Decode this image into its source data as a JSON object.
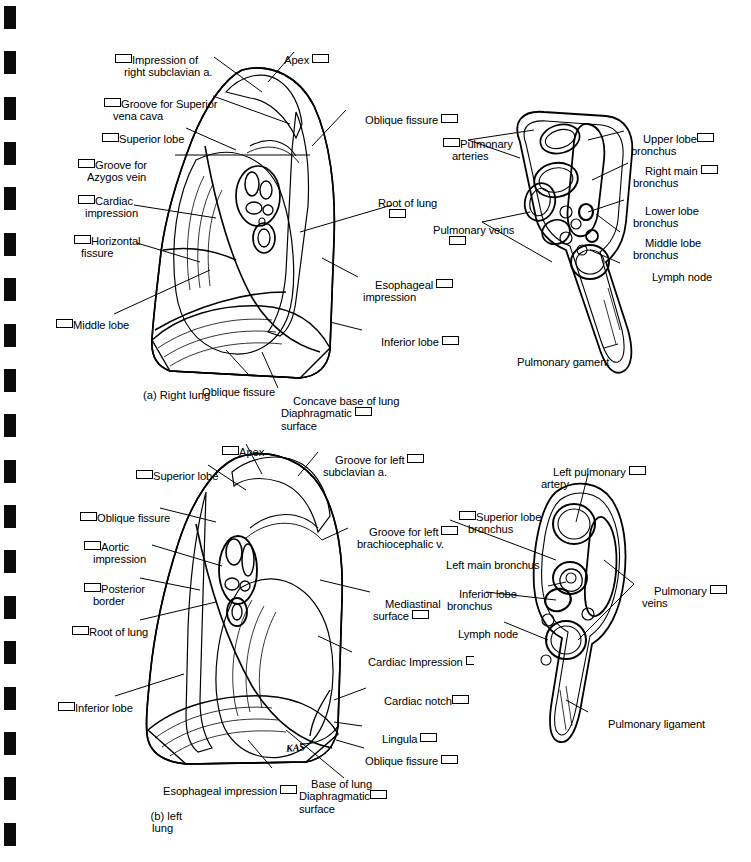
{
  "page": {
    "background": "#ffffff",
    "ink": "#000000",
    "width": 751,
    "height": 862,
    "binding_marks": 19
  },
  "figures": [
    {
      "id": "right-lung",
      "caption": "(a) Right lung",
      "labels_left": [
        {
          "name": "impression-of-right-subclavian-a",
          "lines": [
            "Impression of",
            "right subclavian a."
          ],
          "box": "before"
        },
        {
          "name": "groove-for-superior-vena-cava",
          "lines": [
            "Groove for Superior",
            "vena cava"
          ],
          "box": "before"
        },
        {
          "name": "superior-lobe",
          "lines": [
            "Superior lobe"
          ],
          "box": "before"
        },
        {
          "name": "groove-for-azygos-vein",
          "lines": [
            "Groove for",
            "Azygos vein"
          ],
          "box": "before"
        },
        {
          "name": "cardiac-impression",
          "lines": [
            "Cardiac",
            "impression"
          ],
          "box": "before"
        },
        {
          "name": "horizontal-fissure",
          "lines": [
            "Horizontal",
            "fissure"
          ],
          "box": "before"
        },
        {
          "name": "middle-lobe",
          "lines": [
            "Middle lobe"
          ],
          "box": "before"
        }
      ],
      "labels_other": [
        {
          "name": "apex",
          "lines": [
            "Apex"
          ],
          "box": "after"
        },
        {
          "name": "oblique-fissure-upper",
          "lines": [
            "Oblique fissure"
          ],
          "box": "after"
        },
        {
          "name": "root-of-lung",
          "lines": [
            "Root of lung"
          ],
          "box": "below"
        },
        {
          "name": "esophageal-impression",
          "lines": [
            "Esophageal",
            "impression"
          ],
          "box": "after-first-line"
        },
        {
          "name": "inferior-lobe",
          "lines": [
            "Inferior lobe"
          ],
          "box": "after"
        },
        {
          "name": "oblique-fissure-lower",
          "lines": [
            "Oblique fissure"
          ],
          "box": "none"
        },
        {
          "name": "concave-base-diaphragmatic-surface",
          "lines": [
            "Concave base of lung",
            "Diaphragmatic",
            "surface"
          ],
          "box": "after-second-line"
        }
      ]
    },
    {
      "id": "right-hilum",
      "labels": [
        {
          "name": "pulmonary-arteries",
          "lines": [
            "Pulmonary",
            "arteries"
          ],
          "box": "before"
        },
        {
          "name": "pulmonary-veins",
          "lines": [
            "Pulmonary veins"
          ],
          "box": "below"
        },
        {
          "name": "upper-lobe-bronchus",
          "lines": [
            "Upper lobe",
            "bronchus"
          ],
          "box": "after-first-line"
        },
        {
          "name": "right-main-bronchus",
          "lines": [
            "Right main",
            "bronchus"
          ],
          "box": "after-first-line"
        },
        {
          "name": "lower-lobe-bronchus",
          "lines": [
            "Lower lobe",
            "bronchus"
          ],
          "box": "none"
        },
        {
          "name": "middle-lobe-bronchus",
          "lines": [
            "Middle lobe",
            "bronchus"
          ],
          "box": "none"
        },
        {
          "name": "lymph-node",
          "lines": [
            "Lymph node"
          ],
          "box": "none"
        },
        {
          "name": "pulmonary-gament",
          "lines": [
            "Pulmonary gament"
          ],
          "box": "none"
        }
      ]
    },
    {
      "id": "left-lung",
      "caption": "(b) left\n    lung",
      "labels_left": [
        {
          "name": "apex",
          "lines": [
            "Apex"
          ],
          "box": "before"
        },
        {
          "name": "superior-lobe",
          "lines": [
            "Superior lobe"
          ],
          "box": "before"
        },
        {
          "name": "oblique-fissure",
          "lines": [
            "Oblique fissure"
          ],
          "box": "before"
        },
        {
          "name": "aortic-impression",
          "lines": [
            "Aortic",
            "impression"
          ],
          "box": "before"
        },
        {
          "name": "posterior-border",
          "lines": [
            "Posterior",
            "border"
          ],
          "box": "before"
        },
        {
          "name": "root-of-lung",
          "lines": [
            "Root of lung"
          ],
          "box": "before"
        },
        {
          "name": "inferior-lobe",
          "lines": [
            "Inferior lobe"
          ],
          "box": "before"
        }
      ],
      "labels_right": [
        {
          "name": "groove-for-left-subclavian-a",
          "lines": [
            "Groove for left",
            "subclavian a."
          ],
          "box": "after-first-line"
        },
        {
          "name": "groove-for-left-brachiocephalic-v",
          "lines": [
            "Groove for left",
            "brachiocephalic v."
          ],
          "box": "after-first-line"
        },
        {
          "name": "mediastinal-surface",
          "lines": [
            "Mediastinal",
            "surface"
          ],
          "box": "after-second-line"
        },
        {
          "name": "cardiac-impression",
          "lines": [
            "Cardiac Impression"
          ],
          "box": "after-half"
        },
        {
          "name": "cardiac-notch",
          "lines": [
            "Cardiac notch"
          ],
          "box": "after"
        },
        {
          "name": "lingula",
          "lines": [
            "Lingula"
          ],
          "box": "after"
        },
        {
          "name": "oblique-fissure-lower",
          "lines": [
            "Oblique fissure"
          ],
          "box": "after"
        }
      ],
      "labels_bottom": [
        {
          "name": "esophageal-impression",
          "lines": [
            "Esophageal impression"
          ],
          "box": "after"
        },
        {
          "name": "base-of-lung-diaphragmatic-surface",
          "lines": [
            "Base of lung",
            "Diaphragmatic",
            "surface"
          ],
          "box": "after-second-line"
        }
      ],
      "artist_signature": "KAS"
    },
    {
      "id": "left-hilum",
      "labels": [
        {
          "name": "left-pulmonary-artery",
          "lines": [
            "Left pulmonary",
            "artery"
          ],
          "box": "after-first-line"
        },
        {
          "name": "superior-lobe-bronchus",
          "lines": [
            "Superior lobe",
            "bronchus"
          ],
          "box": "before"
        },
        {
          "name": "left-main-bronchus",
          "lines": [
            "Left main bronchus"
          ],
          "box": "none"
        },
        {
          "name": "inferior-lobe-bronchus",
          "lines": [
            "Inferior lobe",
            "bronchus"
          ],
          "box": "none"
        },
        {
          "name": "lymph-node",
          "lines": [
            "Lymph node"
          ],
          "box": "none"
        },
        {
          "name": "pulmonary-veins",
          "lines": [
            "Pulmonary",
            "veins"
          ],
          "box": "after-first-line"
        },
        {
          "name": "pulmonary-ligament",
          "lines": [
            "Pulmonary ligament"
          ],
          "box": "none"
        }
      ]
    }
  ],
  "text": {
    "impression_of_right_subclavian_a_1": "Impression of",
    "impression_of_right_subclavian_a_2": "right subclavian a.",
    "groove_for_superior_vena_cava_1": "Groove for Superior",
    "groove_for_superior_vena_cava_2": "vena cava",
    "superior_lobe": "Superior lobe",
    "groove_for_azygos_vein_1": "Groove for",
    "groove_for_azygos_vein_2": "Azygos vein",
    "cardiac_impression_1": "Cardiac",
    "cardiac_impression_2": "impression",
    "horizontal_fissure_1": "Horizontal",
    "horizontal_fissure_2": "fissure",
    "middle_lobe": "Middle lobe",
    "apex": "Apex",
    "oblique_fissure": "Oblique fissure",
    "root_of_lung": "Root of lung",
    "esophageal_impression_1": "Esophageal",
    "esophageal_impression_2": "impression",
    "inferior_lobe": "Inferior lobe",
    "concave_base_of_lung": "Concave base of lung",
    "diaphragmatic": "Diaphragmatic",
    "surface": "surface",
    "caption_a": "(a) Right lung",
    "pulmonary_arteries_1": "Pulmonary",
    "pulmonary_arteries_2": "arteries",
    "pulmonary_veins": "Pulmonary veins",
    "upper_lobe": "Upper lobe",
    "bronchus": "bronchus",
    "right_main": "Right main",
    "lower_lobe": "Lower lobe",
    "middle_lobe_b": "Middle lobe",
    "lymph_node": "Lymph node",
    "pulmonary_gament": "Pulmonary gament",
    "groove_for_left_1": "Groove for left",
    "subclavian_a": "subclavian a.",
    "brachiocephalic_v": "brachiocephalic v.",
    "aortic": "Aortic",
    "impression": "impression",
    "posterior": "Posterior",
    "border": "border",
    "mediastinal": "Mediastinal",
    "mediastinal_surface": "surface",
    "cardiac_impression_cap": "Cardiac Impression",
    "cardiac_notch": "Cardiac notch",
    "lingula": "Lingula",
    "esophageal_impression_full": "Esophageal impression",
    "base_of_lung": "Base of lung",
    "caption_b_1": "(b) left",
    "caption_b_2": "lung",
    "signature": "KAS",
    "left_pulmonary": "Left pulmonary",
    "artery": "artery",
    "superior_lobe_b": "Superior lobe",
    "left_main_bronchus": "Left main bronchus",
    "inferior_lobe_b": "Inferior lobe",
    "pulmonary": "Pulmonary",
    "veins": "veins",
    "pulmonary_ligament": "Pulmonary ligament"
  }
}
